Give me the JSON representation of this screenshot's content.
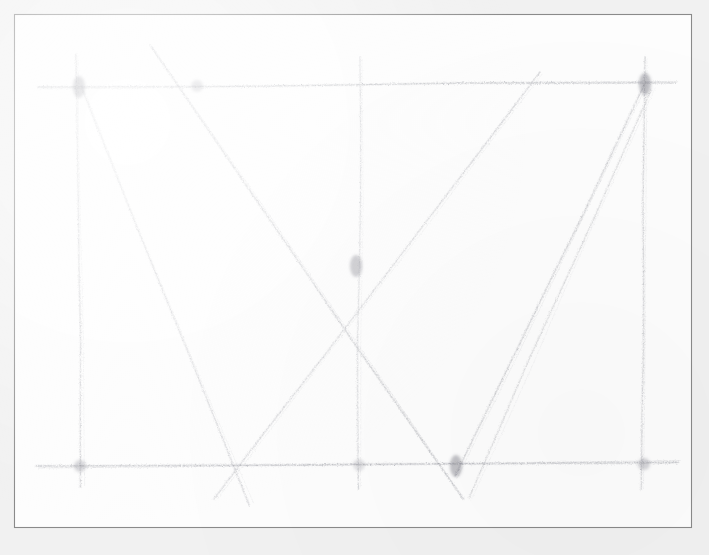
{
  "artwork": {
    "title": "Pencil sketch of a geometric line figure",
    "medium": "graphite pencil on paper",
    "style": "hand-drawn sketch",
    "background_color": "#f1f1f1",
    "paper_color": "#fdfdfd",
    "stroke_color": "#8e8e96",
    "frame_color": "#8a8a8a",
    "canvas": {
      "width": 709,
      "height": 555
    },
    "frame": {
      "x": 14,
      "y": 14,
      "width": 678,
      "height": 514
    }
  },
  "chart_data": {
    "type": "line",
    "xlabel": "",
    "ylabel": "",
    "xlim": [
      14,
      692
    ],
    "ylim": [
      14,
      528
    ],
    "grid": false,
    "legend_position": "none",
    "strokes": [
      {
        "name": "top-horizontal-rail",
        "kind": "horizontal",
        "x1": 38,
        "y1": 87,
        "x2": 676,
        "y2": 83,
        "weight": 1.5,
        "opacity": 0.55
      },
      {
        "name": "bottom-horizontal-rail",
        "kind": "horizontal",
        "x1": 36,
        "y1": 466,
        "x2": 678,
        "y2": 463,
        "weight": 1.7,
        "opacity": 0.58
      },
      {
        "name": "left-upright",
        "kind": "vertical",
        "x1": 76,
        "y1": 54,
        "x2": 82,
        "y2": 487,
        "weight": 1.4,
        "opacity": 0.45
      },
      {
        "name": "center-upright",
        "kind": "vertical",
        "x1": 360,
        "y1": 57,
        "x2": 359,
        "y2": 489,
        "weight": 1.3,
        "opacity": 0.4
      },
      {
        "name": "right-upright",
        "kind": "vertical",
        "x1": 645,
        "y1": 57,
        "x2": 643,
        "y2": 490,
        "weight": 1.4,
        "opacity": 0.45
      },
      {
        "name": "diagonal-left-descending",
        "kind": "diagonal",
        "x1": 81,
        "y1": 86,
        "x2": 250,
        "y2": 505,
        "weight": 1.4,
        "opacity": 0.42
      },
      {
        "name": "diagonal-upper-left-to-center",
        "kind": "diagonal",
        "x1": 150,
        "y1": 45,
        "x2": 462,
        "y2": 500,
        "weight": 1.6,
        "opacity": 0.5
      },
      {
        "name": "diagonal-center-to-lower-left",
        "kind": "diagonal",
        "x1": 540,
        "y1": 72,
        "x2": 215,
        "y2": 500,
        "weight": 1.4,
        "opacity": 0.42
      },
      {
        "name": "diagonal-right-ascending",
        "kind": "diagonal",
        "x1": 455,
        "y1": 476,
        "x2": 646,
        "y2": 85,
        "weight": 1.5,
        "opacity": 0.46
      },
      {
        "name": "diagonal-lower-right-brace",
        "kind": "diagonal",
        "x1": 469,
        "y1": 498,
        "x2": 652,
        "y2": 90,
        "weight": 1.3,
        "opacity": 0.38
      }
    ],
    "intersections": [
      {
        "name": "central-x-crossing",
        "x": 356,
        "y": 266,
        "emphasis": "dark"
      },
      {
        "name": "top-left-node",
        "x": 79,
        "y": 87,
        "emphasis": "dark"
      },
      {
        "name": "top-right-node",
        "x": 645,
        "y": 84,
        "emphasis": "dark"
      },
      {
        "name": "top-mid-left-node",
        "x": 197,
        "y": 86,
        "emphasis": "medium"
      },
      {
        "name": "bottom-left-node",
        "x": 80,
        "y": 466,
        "emphasis": "medium"
      },
      {
        "name": "bottom-center-node",
        "x": 359,
        "y": 465,
        "emphasis": "light"
      },
      {
        "name": "bottom-brace-node",
        "x": 456,
        "y": 466,
        "emphasis": "dark"
      },
      {
        "name": "bottom-right-node",
        "x": 644,
        "y": 464,
        "emphasis": "medium"
      }
    ]
  }
}
